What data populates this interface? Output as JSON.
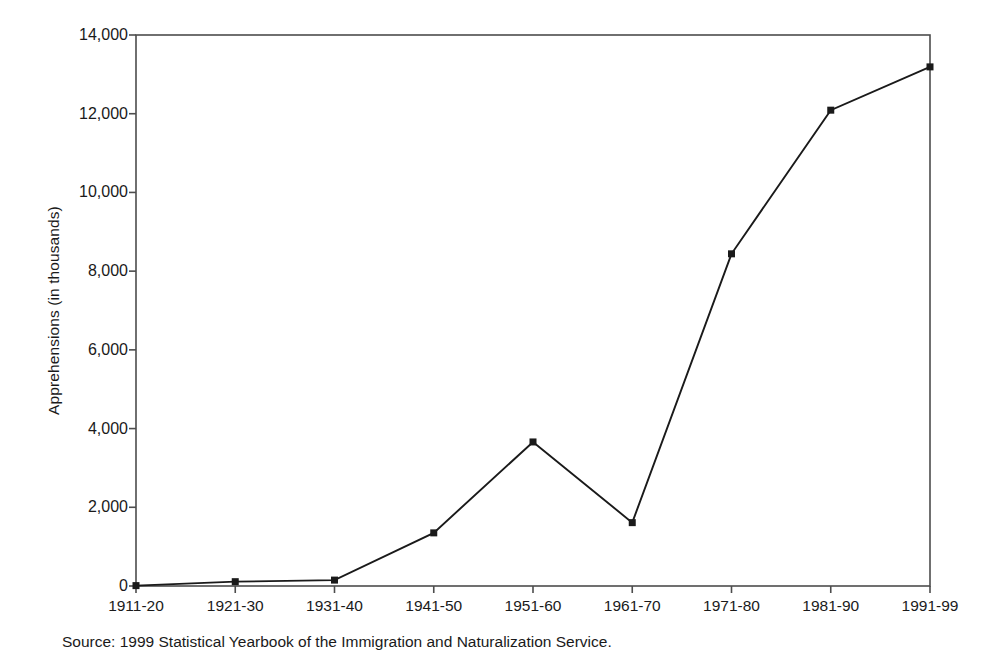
{
  "chart_data": {
    "type": "line",
    "title": "",
    "subtitle": "",
    "xlabel": "",
    "ylabel": "Apprehensions (in thousands)",
    "categories": [
      "1911-20",
      "1921-30",
      "1931-40",
      "1941-50",
      "1951-60",
      "1961-70",
      "1971-80",
      "1981-90",
      "1991-99"
    ],
    "values": [
      10,
      110,
      150,
      1350,
      3660,
      1610,
      8440,
      12090,
      13190
    ],
    "series": [
      {
        "name": "Apprehensions",
        "values": [
          10,
          110,
          150,
          1350,
          3660,
          1610,
          8440,
          12090,
          13190
        ]
      }
    ],
    "ylim": [
      0,
      14000
    ],
    "yticks": [
      0,
      2000,
      4000,
      6000,
      8000,
      10000,
      12000,
      14000
    ],
    "ytick_labels": [
      "0",
      "2,000",
      "4,000",
      "6,000",
      "8,000",
      "10,000",
      "12,000",
      "14,000"
    ],
    "grid": false,
    "legend": false,
    "legend_position": "none",
    "marker": "square",
    "line_color": "#1a1a1a",
    "marker_color": "#1a1a1a",
    "axis_color": "#4d4d4d",
    "background_color": "#ffffff"
  },
  "source_note": "Source: 1999 Statistical Yearbook of the Immigration and Naturalization Service."
}
